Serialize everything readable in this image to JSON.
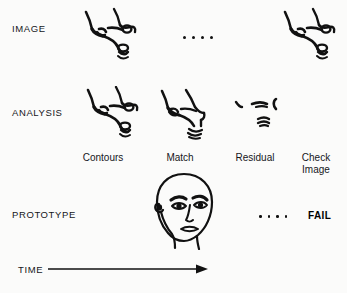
{
  "figure": {
    "type": "process-flow-diagram",
    "background_color": "#fbfbfa",
    "ink_color": "#111111"
  },
  "rows": [
    {
      "key": "image",
      "label": "IMAGE"
    },
    {
      "key": "analysis",
      "label": "ANALYSIS"
    },
    {
      "key": "prototype",
      "label": "PROTOTYPE"
    }
  ],
  "captions": [
    {
      "key": "contours",
      "line1": "Contours",
      "line2": ""
    },
    {
      "key": "match",
      "line1": "Match",
      "line2": ""
    },
    {
      "key": "residual",
      "line1": "Residual",
      "line2": ""
    },
    {
      "key": "check-image",
      "line1": "Check",
      "line2": "Image"
    }
  ],
  "image_row": {
    "sketches": [
      "face-profile-sketch",
      "face-profile-sketch"
    ],
    "ellipsis_dots": 4
  },
  "analysis_row": {
    "sketches": [
      "contours-profile-sketch",
      "match-profile-sketch",
      "residual-fragments-sketch"
    ]
  },
  "prototype_row": {
    "sketch": "frontal-face-prototype",
    "ellipsis_dots": 4,
    "result_label": "FAIL"
  },
  "time_axis": {
    "label": "TIME",
    "arrow": "right-arrow"
  }
}
